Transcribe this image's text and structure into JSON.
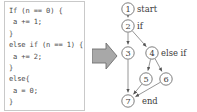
{
  "code_panel": {
    "name": "source-code-snippet",
    "lines": [
      "If (n == 0) {",
      " a += 1;",
      "}",
      "else if (n == 1) {",
      " a += 2;",
      "}",
      "else{",
      " a = 0;",
      "}"
    ]
  },
  "transform_arrow": {
    "icon": "right-block-arrow",
    "fill": "#a8a8a8",
    "stroke": "#6f6f6f"
  },
  "graph": {
    "title": "control-flow-graph",
    "node_fill": "#ffffff",
    "node_stroke": "#6f6f6f",
    "edge_color": "#8a8a8a",
    "nodes": [
      {
        "id": "1",
        "label": "1",
        "annotation": "start",
        "cx": 13,
        "cy": 9,
        "r": 6.2,
        "ann_x": 22,
        "ann_y": 12
      },
      {
        "id": "2",
        "label": "2",
        "annotation": "if",
        "cx": 13,
        "cy": 26,
        "r": 6.2,
        "ann_x": 22,
        "ann_y": 29
      },
      {
        "id": "3",
        "label": "3",
        "annotation": "",
        "cx": 13,
        "cy": 53,
        "r": 6.2,
        "ann_x": 0,
        "ann_y": 0
      },
      {
        "id": "4",
        "label": "4",
        "annotation": "else if",
        "cx": 37,
        "cy": 53,
        "r": 6.2,
        "ann_x": 46,
        "ann_y": 56
      },
      {
        "id": "5",
        "label": "5",
        "annotation": "",
        "cx": 31,
        "cy": 79,
        "r": 6.2,
        "ann_x": 0,
        "ann_y": 0
      },
      {
        "id": "6",
        "label": "6",
        "annotation": "",
        "cx": 51,
        "cy": 79,
        "r": 6.2,
        "ann_x": 0,
        "ann_y": 0
      },
      {
        "id": "7",
        "label": "7",
        "annotation": "end",
        "cx": 13,
        "cy": 101,
        "r": 6.2,
        "ann_x": 27,
        "ann_y": 104
      }
    ],
    "edges": [
      {
        "from": "1",
        "to": "2"
      },
      {
        "from": "2",
        "to": "3"
      },
      {
        "from": "2",
        "to": "4"
      },
      {
        "from": "3",
        "to": "7"
      },
      {
        "from": "4",
        "to": "5"
      },
      {
        "from": "4",
        "to": "6"
      },
      {
        "from": "5",
        "to": "7"
      },
      {
        "from": "6",
        "to": "7"
      }
    ]
  }
}
